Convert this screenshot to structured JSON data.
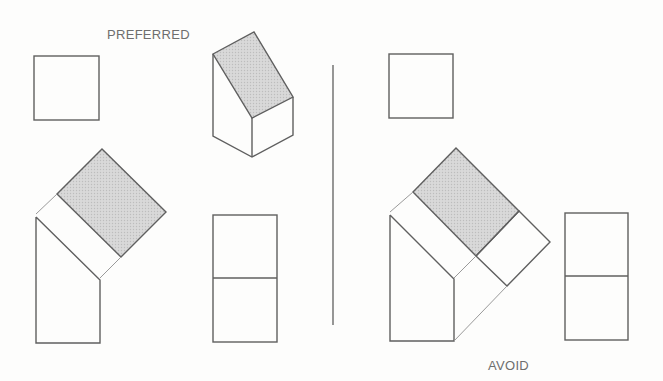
{
  "labels": {
    "preferred": "PREFERRED",
    "avoid": "AVOID"
  },
  "colors": {
    "line": "#5f5f5f",
    "light_line": "#9a9a9a",
    "shade": "#d2d2d2",
    "background": "#fdfdfc"
  },
  "panels": [
    {
      "name": "preferred",
      "views": [
        "top-view-square",
        "isometric-prism",
        "auxiliary-view-bent",
        "front-view-split-rectangle"
      ]
    },
    {
      "name": "avoid",
      "views": [
        "top-view-square",
        "auxiliary-view-bent-extended",
        "front-view-split-rectangle"
      ]
    }
  ]
}
